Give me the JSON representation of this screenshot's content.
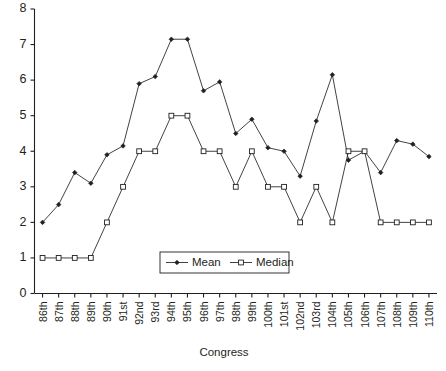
{
  "chart_data": {
    "type": "line",
    "title": "",
    "xlabel": "Congress",
    "ylabel": "",
    "ylim": [
      0,
      8
    ],
    "yticks": [
      0,
      1,
      2,
      3,
      4,
      5,
      6,
      7,
      8
    ],
    "grid": false,
    "legend_position": "inside-bottom-center",
    "categories": [
      "86th",
      "87th",
      "88th",
      "89th",
      "90th",
      "91st",
      "92nd",
      "93rd",
      "94th",
      "95th",
      "96th",
      "97th",
      "98th",
      "99th",
      "100th",
      "101st",
      "102nd",
      "103rd",
      "104th",
      "105th",
      "106th",
      "107th",
      "108th",
      "109th",
      "110th"
    ],
    "series": [
      {
        "name": "Mean",
        "marker": "filled-diamond",
        "values": [
          2.0,
          2.5,
          3.4,
          3.1,
          3.9,
          4.15,
          5.9,
          6.1,
          7.15,
          7.15,
          5.7,
          5.95,
          4.5,
          4.9,
          4.1,
          4.0,
          3.3,
          4.85,
          6.15,
          3.75,
          4.0,
          3.4,
          4.3,
          4.2,
          3.85
        ]
      },
      {
        "name": "Median",
        "marker": "open-square",
        "values": [
          1,
          1,
          1,
          1,
          2,
          3,
          4,
          4,
          5,
          5,
          4,
          4,
          3,
          4,
          3,
          3,
          2,
          3,
          2,
          4,
          4,
          2,
          2,
          2,
          2
        ]
      }
    ]
  },
  "legend": {
    "items": [
      {
        "label": "Mean"
      },
      {
        "label": "Median"
      }
    ]
  },
  "axes": {
    "x_title": "Congress",
    "y_tick_labels": [
      "0",
      "1",
      "2",
      "3",
      "4",
      "5",
      "6",
      "7",
      "8"
    ],
    "x_tick_labels": [
      "86th",
      "87th",
      "88th",
      "89th",
      "90th",
      "91st",
      "92nd",
      "93rd",
      "94th",
      "95th",
      "96th",
      "97th",
      "98th",
      "99th",
      "100th",
      "101st",
      "102nd",
      "103rd",
      "104th",
      "105th",
      "106th",
      "107th",
      "108th",
      "109th",
      "110th"
    ]
  },
  "colors": {
    "ink": "#231f20",
    "background": "#ffffff"
  }
}
